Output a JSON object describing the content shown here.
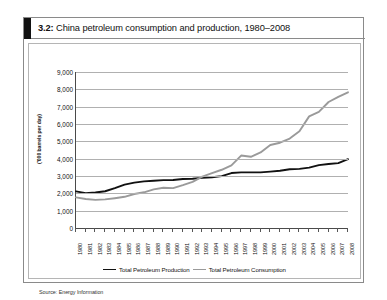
{
  "figure": {
    "number": "3.2:",
    "title": "China petroleum consumption and production, 1980–2008",
    "source": "Source: Energy Information"
  },
  "chart_data": {
    "type": "line",
    "title": "China petroleum consumption and production, 1980–2008",
    "xlabel": "",
    "ylabel": "('000 barrels per day)",
    "ylim": [
      0,
      9000
    ],
    "ytick_labels": [
      "9,000",
      "8,000",
      "7,000",
      "6,000",
      "5,000",
      "4,000",
      "3,000",
      "2,000",
      "1,000",
      "0"
    ],
    "yticks": [
      9000,
      8000,
      7000,
      6000,
      5000,
      4000,
      3000,
      2000,
      1000,
      0
    ],
    "grid": true,
    "legend_position": "bottom",
    "categories": [
      "1980",
      "1981",
      "1982",
      "1983",
      "1984",
      "1985",
      "1986",
      "1987",
      "1988",
      "1989",
      "1990",
      "1991",
      "1992",
      "1993",
      "1994",
      "1995",
      "1996",
      "1997",
      "1998",
      "1999",
      "2000",
      "2001",
      "2002",
      "2003",
      "2004",
      "2005",
      "2006",
      "2007",
      "2008"
    ],
    "series": [
      {
        "name": "Total Petroleum Production",
        "color": "#111111",
        "values": [
          2114,
          2012,
          2045,
          2120,
          2300,
          2505,
          2620,
          2690,
          2730,
          2760,
          2770,
          2830,
          2840,
          2890,
          2930,
          2990,
          3170,
          3210,
          3210,
          3210,
          3250,
          3300,
          3390,
          3410,
          3480,
          3630,
          3690,
          3740,
          3970
        ]
      },
      {
        "name": "Total Petroleum Consumption",
        "color": "#9a9a9a",
        "values": [
          1765,
          1670,
          1620,
          1650,
          1720,
          1800,
          1960,
          2060,
          2230,
          2320,
          2300,
          2470,
          2660,
          2960,
          3160,
          3360,
          3610,
          4180,
          4110,
          4360,
          4790,
          4920,
          5160,
          5580,
          6440,
          6700,
          7270,
          7560,
          7830
        ]
      }
    ]
  },
  "legend": [
    {
      "label": "Total Petroleum Production"
    },
    {
      "label": "Total Petroleum Consumption"
    }
  ]
}
